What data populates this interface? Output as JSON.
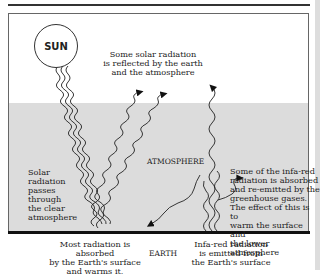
{
  "diagram": {
    "sun_label": "SUN",
    "reflected_label": [
      "Some solar radiation",
      "is reflected by the earth",
      "and the atmosphere"
    ],
    "atmosphere_label": "ATMOSPHERE",
    "passes_label": [
      "Solar",
      "radiation",
      "passes",
      "through",
      "the clear",
      "atmosphere"
    ],
    "greenhouse_label": [
      "Some of the infa-red",
      "radiation is absorbed",
      "and re-emitted by the",
      "greenhouse gases.",
      "The effect of this is to",
      "warm the surface and",
      "the lower atmosphere"
    ],
    "absorbed_label": [
      "Most radiation is absorbed",
      "by the Earth's surface",
      "and warms it."
    ],
    "earth_label": "EARTH",
    "infrared_label": [
      "Infa-red radiation",
      "is emitted from",
      "the Earth's surface"
    ]
  },
  "colors": {
    "atmosphere": "#dcdcdc",
    "lines": "#222222",
    "background": "#ffffff"
  }
}
